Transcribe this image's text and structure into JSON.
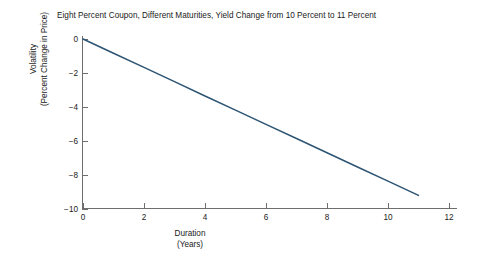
{
  "chart_data": {
    "type": "line",
    "title": "Eight Percent Coupon, Different Maturities, Yield Change from 10 Percent to 11 Percent",
    "xlabel_line1": "Duration",
    "xlabel_line2": "(Years)",
    "ylabel_line1": "Volatility",
    "ylabel_line2": "(Percent Change in Price)",
    "xlim": [
      0,
      12
    ],
    "ylim": [
      -10,
      0
    ],
    "xticks": [
      0,
      2,
      4,
      6,
      8,
      10,
      12
    ],
    "xtick_labels": [
      "0",
      "2",
      "4",
      "6",
      "8",
      "10",
      "12"
    ],
    "yticks": [
      0,
      -2,
      -4,
      -6,
      -8,
      -10
    ],
    "ytick_labels": [
      "0",
      "−2",
      "−4",
      "−6",
      "−8",
      "−10"
    ],
    "grid": false,
    "legend": "none",
    "line_color": "#2d5472",
    "series": [
      {
        "name": "Volatility vs Duration",
        "x": [
          0,
          1,
          2,
          3,
          4,
          5,
          6,
          7,
          8,
          9,
          10,
          11
        ],
        "values": [
          0,
          -0.84,
          -1.67,
          -2.51,
          -3.35,
          -4.18,
          -5.02,
          -5.85,
          -6.69,
          -7.53,
          -8.36,
          -9.2
        ]
      }
    ]
  }
}
